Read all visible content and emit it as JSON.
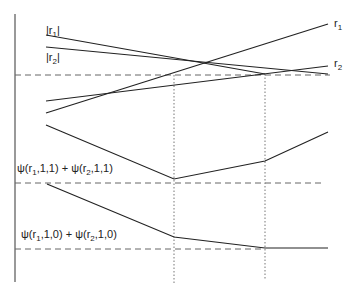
{
  "diagram": {
    "colors": {
      "line": "#222222",
      "dashed": "#666666",
      "dotted": "#777777",
      "background": "#ffffff"
    },
    "axis": {
      "x": 15,
      "y_top": 14,
      "y_bottom": 282
    },
    "top_panel": {
      "labels": {
        "abs_r1": "|r",
        "abs_r1_sub": "1",
        "abs_r2": "|r",
        "abs_r2_sub": "2",
        "r1": "r",
        "r1_sub": "1",
        "r2": "r",
        "r2_sub": "2"
      },
      "threshold_y": 75
    },
    "middle_panel": {
      "label_main": "ψ(r",
      "label_sub1": "1",
      "label_mid": ",1,1) + ψ(r",
      "label_sub2": "2",
      "label_end": ",1,1)",
      "threshold_y": 183
    },
    "bottom_panel": {
      "label_main": "ψ(r",
      "label_sub1": "1",
      "label_mid": ",1,0) + ψ(r",
      "label_sub2": "2",
      "label_end": ",1,0)",
      "threshold_y": 249
    },
    "vertical_guides_x": [
      174,
      265
    ]
  }
}
